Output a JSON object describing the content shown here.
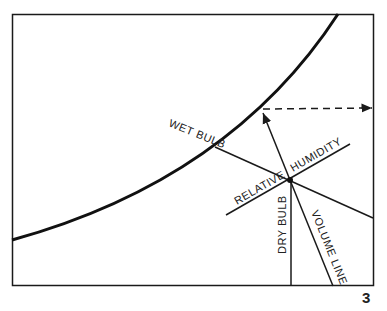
{
  "diagram": {
    "type": "psychrometric-chart-schematic",
    "labels": {
      "wet_bulb": "WET BULB",
      "relative": "RELATIVE",
      "humidity": "HUMIDITY",
      "dry_bulb": "DRY BULB",
      "volume_line": "VOLUME LINE"
    },
    "figure_number": "3",
    "colors": {
      "line": "#1a1a1a",
      "background": "#ffffff"
    }
  }
}
